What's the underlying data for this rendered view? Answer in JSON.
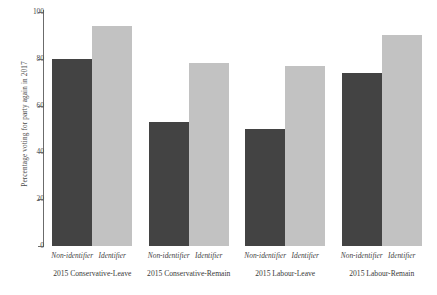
{
  "chart_data": {
    "type": "bar",
    "title": "",
    "xlabel": "",
    "ylabel": "Percentage voting for party again in 2017",
    "ylim": [
      0,
      100
    ],
    "yticks": [
      0,
      20,
      40,
      60,
      80,
      100
    ],
    "grid": false,
    "legend": "none",
    "categories": [
      "2015 Conservative-Leave",
      "2015 Conservative-Remain",
      "2015 Labour-Leave",
      "2015 Labour-Remain"
    ],
    "subcategories": [
      "Non-identifier",
      "Identifier"
    ],
    "series": [
      {
        "name": "Non-identifier",
        "color": "#434343",
        "values": [
          80,
          53,
          50,
          74
        ]
      },
      {
        "name": "Identifier",
        "color": "#c2c2c2",
        "values": [
          94,
          78,
          77,
          90
        ]
      }
    ]
  },
  "axis": {
    "y_title": "Percentage voting for party again in 2017",
    "tick_labels": [
      "0",
      "20",
      "40",
      "60",
      "80",
      "100"
    ]
  },
  "groups": [
    {
      "label": "2015 Conservative-Leave",
      "bars": [
        {
          "series": "Non-identifier",
          "value": 80
        },
        {
          "series": "Identifier",
          "value": 94
        }
      ]
    },
    {
      "label": "2015 Conservative-Remain",
      "bars": [
        {
          "series": "Non-identifier",
          "value": 53
        },
        {
          "series": "Identifier",
          "value": 78
        }
      ]
    },
    {
      "label": "2015 Labour-Leave",
      "bars": [
        {
          "series": "Non-identifier",
          "value": 50
        },
        {
          "series": "Identifier",
          "value": 77
        }
      ]
    },
    {
      "label": "2015 Labour-Remain",
      "bars": [
        {
          "series": "Non-identifier",
          "value": 74
        },
        {
          "series": "Identifier",
          "value": 90
        }
      ]
    }
  ],
  "colors": {
    "non_identifier": "#434343",
    "identifier": "#c2c2c2",
    "axis": "#6b6b6b",
    "text": "#3a3a3a",
    "background": "#ffffff"
  }
}
